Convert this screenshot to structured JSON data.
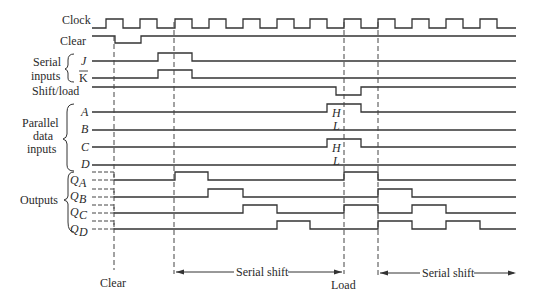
{
  "signals": {
    "clock": "Clock",
    "clear": "Clear",
    "serial_group": [
      "Serial",
      "inputs"
    ],
    "j": "J",
    "k": "K",
    "shift_load": "Shift/load",
    "parallel_group": [
      "Parallel",
      "data",
      "inputs"
    ],
    "a": "A",
    "b": "B",
    "c": "C",
    "d": "D",
    "outputs_group": "Outputs",
    "qa": "Q",
    "qa_sub": "A",
    "qb": "Q",
    "qb_sub": "B",
    "qc": "Q",
    "qc_sub": "C",
    "qd": "Q",
    "qd_sub": "D"
  },
  "levels": {
    "a_high": "H",
    "a_low": "L",
    "c_high": "H",
    "c_low": "L"
  },
  "annotations": {
    "clear": "Clear",
    "serial_shift_1": "Serial shift",
    "load": "Load",
    "serial_shift_2": "Serial shift"
  },
  "timing": {
    "clock_rising_edges_x": [
      106,
      140,
      175,
      209,
      243,
      277,
      310,
      344,
      378,
      412,
      446,
      480
    ],
    "clock_period_px": 34,
    "markers_x": {
      "clear": 114,
      "shift_start": 174,
      "load": 344,
      "shift_restart": 378
    },
    "waveforms": {
      "clear": "low 114-140",
      "j": "high 140-175",
      "k": "high 140-175",
      "shift_load": "low 336-360",
      "a": "high 336-360",
      "c": "high 336-360",
      "qa": "high 175-208, 344-378",
      "qb": "high 208-243, 378-412",
      "qc": "high 243-277, 344-378, 412-446",
      "qd": "high 277-310, 378-412, 446-480"
    }
  }
}
